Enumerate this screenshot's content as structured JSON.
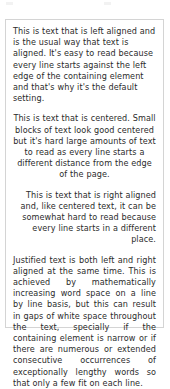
{
  "page": {
    "background_color": "#ffffff",
    "text_color": "#2b2b2b",
    "border_color": "#d4d4d4"
  },
  "text_box": {
    "paragraphs": [
      {
        "alignment": "left",
        "text": "This is text that is left aligned and is the usual way that text is aligned. It's easy to read because every line starts against the left edge of the containing element and that's why it's the default setting."
      },
      {
        "alignment": "center",
        "text": "This is text that is centered. Small blocks of text look good centered but it's hard large amounts of text to read as every line starts a different distance from the edge of the page."
      },
      {
        "alignment": "right",
        "text": "This is text that is right aligned and, like centered text, it can be somewhat hard to read because every line starts in a different place."
      },
      {
        "alignment": "justify",
        "text": "Justified text is both left and right aligned at the same time. This is achieved by mathematically increasing word space on a line by line basis, but this can result in gaps of white space throughout the text, specially if the containing element is narrow or if there are numerous or extended consecutive occurrences of exceptionally lengthy words so that only a few fit on each line."
      }
    ]
  }
}
